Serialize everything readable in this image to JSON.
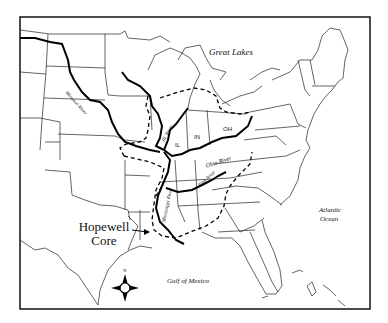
{
  "map": {
    "title_labels": {
      "great_lakes": "Great Lakes",
      "atlantic": "Atlantic",
      "ocean": "Ocean",
      "gulf": "Gulf of Mexico"
    },
    "rivers": {
      "missouri": "Missouri River",
      "illinois": "Ill. River",
      "ohio": "Ohio River",
      "mississippi": "Mississippi River",
      "tennessee": "Tenn River"
    },
    "states": {
      "il": "IL",
      "in": "IN",
      "oh": "OH"
    },
    "core_label": {
      "line1": "Hopewell",
      "line2": "Core"
    },
    "compass": {
      "north": "N"
    },
    "colors": {
      "ink": "#111111",
      "background": "#ffffff"
    }
  }
}
